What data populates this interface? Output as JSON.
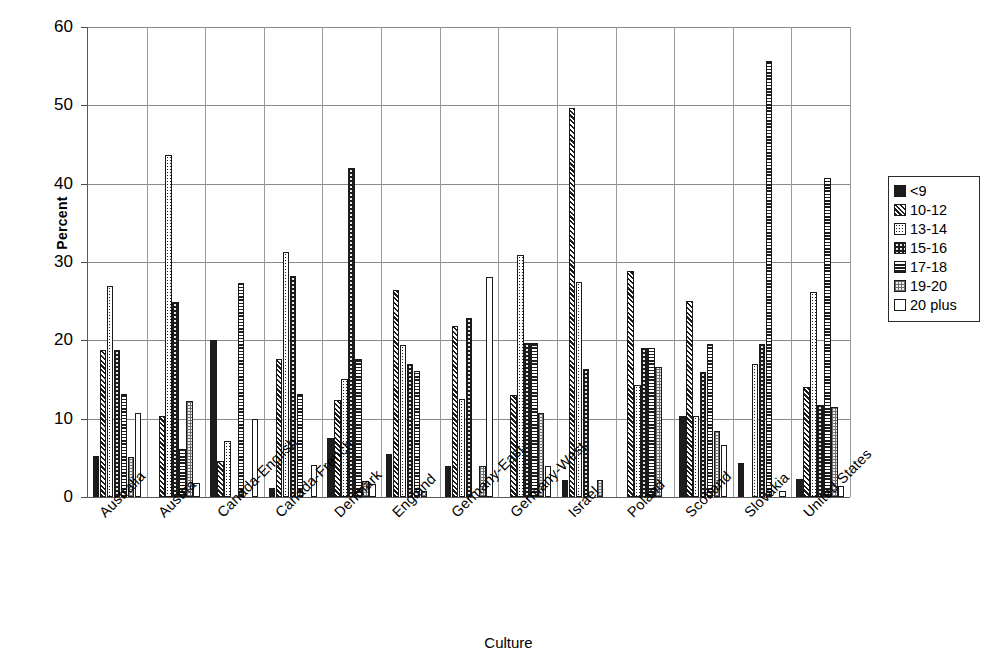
{
  "chart_data": {
    "type": "bar",
    "title": "",
    "xlabel": "Culture",
    "ylabel": "Percent",
    "ylim": [
      0,
      60
    ],
    "yticks": [
      0,
      10,
      20,
      30,
      40,
      50,
      60
    ],
    "grid": true,
    "legend_position": "right",
    "categories": [
      "Australia",
      "Austria",
      "Canada-English",
      "Canada-French",
      "Denmark",
      "England",
      "Germany-East",
      "Germany-West",
      "Israel",
      "Poland",
      "Scotland",
      "Slovakia",
      "United States"
    ],
    "series": [
      {
        "name": "<9",
        "pattern": "solid-black",
        "values": [
          5.2,
          0,
          20.0,
          1.2,
          7.5,
          5.5,
          4.0,
          0,
          2.2,
          0,
          10.4,
          4.4,
          2.3
        ]
      },
      {
        "name": "10-12",
        "pattern": "diagonal-hatch",
        "values": [
          18.8,
          10.3,
          4.6,
          17.6,
          12.4,
          26.4,
          21.8,
          13.0,
          49.7,
          28.8,
          25.0,
          0,
          14.0
        ]
      },
      {
        "name": "13-14",
        "pattern": "fine-dotted",
        "values": [
          26.9,
          43.6,
          7.2,
          31.3,
          15.1,
          19.4,
          12.5,
          30.9,
          27.4,
          14.3,
          10.4,
          17.0,
          26.2
        ]
      },
      {
        "name": "15-16",
        "pattern": "black-with-dots",
        "values": [
          18.8,
          24.9,
          0,
          28.2,
          42.0,
          17.0,
          22.9,
          19.6,
          16.3,
          19.0,
          15.9,
          19.5,
          11.8
        ]
      },
      {
        "name": "17-18",
        "pattern": "horizontal-lines",
        "values": [
          13.2,
          6.1,
          27.3,
          13.2,
          17.6,
          16.1,
          0,
          19.6,
          0,
          19.0,
          19.5,
          55.7,
          40.7
        ]
      },
      {
        "name": "19-20",
        "pattern": "grey-stipple",
        "values": [
          5.1,
          12.3,
          0,
          0,
          2.1,
          0.8,
          3.9,
          10.7,
          2.2,
          16.6,
          8.4,
          0,
          11.5
        ]
      },
      {
        "name": "20 plus",
        "pattern": "empty-white",
        "values": [
          10.7,
          1.8,
          10.0,
          4.1,
          1.6,
          0,
          28.1,
          4.0,
          0,
          0,
          6.7,
          0.8,
          1.4
        ]
      }
    ]
  },
  "legend": {
    "entries": [
      "<9",
      "10-12",
      "13-14",
      "15-16",
      "17-18",
      "19-20",
      "20 plus"
    ]
  },
  "colors": {
    "axis": "#5a5a5a",
    "grid": "#8a8a8a",
    "bar_outline": "#1a1a1a",
    "ink": "#1c1c1c",
    "background": "#ffffff"
  }
}
